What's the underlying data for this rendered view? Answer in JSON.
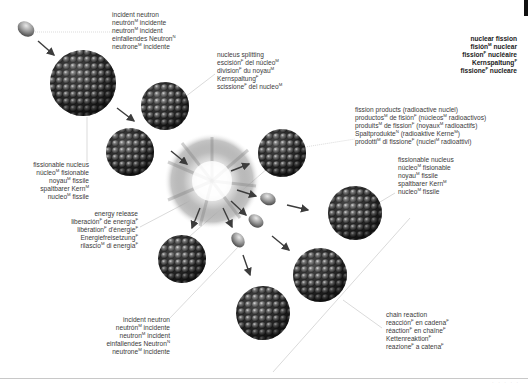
{
  "title_block": {
    "lines": [
      {
        "text": "nuclear fission",
        "sup": ""
      },
      {
        "text": "fisión",
        "sup": "M",
        "after": " nuclear"
      },
      {
        "text": "fission",
        "sup": "F",
        "after": " nucléaire"
      },
      {
        "text": "Kernspaltung",
        "sup": "F",
        "after": ""
      },
      {
        "text": "fissione",
        "sup": "F",
        "after": " nucleare"
      }
    ]
  },
  "labels": {
    "incident_neutron_top": [
      [
        "incident neutron",
        "",
        ""
      ],
      [
        "neutrón",
        "M",
        " incidente"
      ],
      [
        "neutron",
        "M",
        " incident"
      ],
      [
        "einfallendes Neutron",
        "N",
        ""
      ],
      [
        "neutrone",
        "M",
        " incidente"
      ]
    ],
    "nucleus_splitting": [
      [
        "nucleus splitting",
        "",
        ""
      ],
      [
        "escisión",
        "F",
        " del núcleo"
      ],
      [
        "division",
        "F",
        " du noyau"
      ],
      [
        "Kernspaltung",
        "F",
        ""
      ],
      [
        "scissione",
        "F",
        " del nucleo"
      ]
    ],
    "nucleus_splitting_trailing_sups": [
      "",
      "M",
      "M",
      "",
      "M"
    ],
    "fissionable_nucleus_left": [
      [
        "fissionable nucleus",
        "",
        ""
      ],
      [
        "núcleo",
        "M",
        " fisionable"
      ],
      [
        "noyau",
        "M",
        " fissile"
      ],
      [
        "spaltbarer Kern",
        "M",
        ""
      ],
      [
        "nucleo",
        "M",
        " fissile"
      ]
    ],
    "fission_products": [
      "fission products (radioactive nuclei)",
      "productos^M de fisión^F (núcleos^M radioactivos)",
      "produits^M de fission^F (noyaux^M radioactifs)",
      "Spaltprodukte^N (radioaktive Kerne^M)",
      "prodotti^M di fissione^F (nuclei^M radioattivi)"
    ],
    "fissionable_nucleus_right": [
      [
        "fissionable nucleus",
        "",
        ""
      ],
      [
        "núcleo",
        "M",
        " fisionable"
      ],
      [
        "noyau",
        "M",
        " fissile"
      ],
      [
        "spaltbarer Kern",
        "M",
        ""
      ],
      [
        "nucleo",
        "M",
        " fissile"
      ]
    ],
    "energy_release": [
      [
        "energy release",
        "",
        ""
      ],
      [
        "liberación",
        "F",
        " de energía"
      ],
      [
        "libération",
        "F",
        " d'énergie"
      ],
      [
        "Energiefreisetzung",
        "F",
        ""
      ],
      [
        "rilascio",
        "M",
        " di energia"
      ]
    ],
    "energy_release_trailing_sups": [
      "",
      "F",
      "F",
      "",
      "F"
    ],
    "incident_neutron_bottom": [
      [
        "incident neutron",
        "",
        ""
      ],
      [
        "neutrón",
        "M",
        " incidente"
      ],
      [
        "neutron",
        "M",
        " incident"
      ],
      [
        "einfallendes Neutron",
        "N",
        ""
      ],
      [
        "neutrone",
        "M",
        " incidente"
      ]
    ],
    "chain_reaction": [
      [
        "chain reaction",
        "",
        ""
      ],
      [
        "reacción",
        "F",
        " en cadena"
      ],
      [
        "réaction",
        "F",
        " en chaîne"
      ],
      [
        "Kettenreaktion",
        "F",
        ""
      ],
      [
        "reazione",
        "F",
        " a catena"
      ]
    ],
    "chain_reaction_trailing_sups": [
      "",
      "F",
      "F",
      "",
      "F"
    ]
  },
  "colors": {
    "text": "#3a3a3a",
    "nucleus_dark": "#2a2a2a",
    "nucleus_light": "#9a9a9a",
    "arrow": "#3c3c3c",
    "leader_line": "#b0b0b0"
  }
}
